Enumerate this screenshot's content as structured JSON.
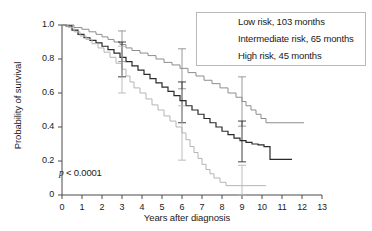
{
  "chart_data": {
    "type": "line",
    "title": "",
    "xlabel": "Years after diagnosis",
    "ylabel": "Probability of survival",
    "xlim": [
      0,
      13
    ],
    "ylim": [
      0,
      1.0
    ],
    "grid": false,
    "xticks": [
      "0",
      "1",
      "2",
      "3",
      "4",
      "5",
      "6",
      "7",
      "8",
      "9",
      "10",
      "11",
      "12",
      "13"
    ],
    "yticks": [
      "0",
      "0.2",
      "0.4",
      "0.6",
      "0.8",
      "1.0"
    ],
    "annotation": "p < 0.0001",
    "annotation_p": "p",
    "annotation_rest": " < 0.0001",
    "legend_position": "top-right",
    "series": [
      {
        "name": "Low risk, 103 months",
        "color": "#8d8d8d",
        "width": 1.0,
        "points": [
          [
            0,
            1.0
          ],
          [
            0.25,
            1.0
          ],
          [
            0.6,
            0.985
          ],
          [
            1.0,
            0.975
          ],
          [
            1.35,
            0.96
          ],
          [
            1.7,
            0.945
          ],
          [
            2.0,
            0.93
          ],
          [
            2.3,
            0.915
          ],
          [
            2.6,
            0.9
          ],
          [
            2.9,
            0.885
          ],
          [
            3.2,
            0.865
          ],
          [
            3.5,
            0.85
          ],
          [
            3.9,
            0.835
          ],
          [
            4.3,
            0.82
          ],
          [
            4.7,
            0.8
          ],
          [
            5.1,
            0.78
          ],
          [
            5.5,
            0.765
          ],
          [
            5.9,
            0.745
          ],
          [
            6.3,
            0.72
          ],
          [
            6.7,
            0.7
          ],
          [
            7.1,
            0.675
          ],
          [
            7.5,
            0.655
          ],
          [
            7.9,
            0.63
          ],
          [
            8.3,
            0.6
          ],
          [
            8.7,
            0.575
          ],
          [
            9.0,
            0.55
          ],
          [
            9.2,
            0.525
          ],
          [
            9.45,
            0.5
          ],
          [
            9.7,
            0.475
          ],
          [
            9.95,
            0.45
          ],
          [
            10.2,
            0.425
          ],
          [
            12.1,
            0.425
          ]
        ],
        "errorbars": [
          {
            "x": 3.0,
            "y": 0.875,
            "lo": 0.785,
            "hi": 0.965
          },
          {
            "x": 6.0,
            "y": 0.745,
            "lo": 0.625,
            "hi": 0.86
          },
          {
            "x": 9.0,
            "y": 0.55,
            "lo": 0.405,
            "hi": 0.695
          }
        ]
      },
      {
        "name": "Intermediate risk, 65 months",
        "color": "#2a2a2a",
        "width": 1.2,
        "points": [
          [
            0,
            1.0
          ],
          [
            0.2,
            0.995
          ],
          [
            0.5,
            0.97
          ],
          [
            0.8,
            0.945
          ],
          [
            1.1,
            0.925
          ],
          [
            1.4,
            0.91
          ],
          [
            1.7,
            0.895
          ],
          [
            2.0,
            0.875
          ],
          [
            2.3,
            0.855
          ],
          [
            2.6,
            0.835
          ],
          [
            2.9,
            0.81
          ],
          [
            3.2,
            0.785
          ],
          [
            3.5,
            0.76
          ],
          [
            3.8,
            0.735
          ],
          [
            4.1,
            0.71
          ],
          [
            4.4,
            0.685
          ],
          [
            4.7,
            0.66
          ],
          [
            5.0,
            0.635
          ],
          [
            5.3,
            0.61
          ],
          [
            5.6,
            0.585
          ],
          [
            5.9,
            0.555
          ],
          [
            6.2,
            0.525
          ],
          [
            6.5,
            0.5
          ],
          [
            6.8,
            0.475
          ],
          [
            7.1,
            0.45
          ],
          [
            7.4,
            0.425
          ],
          [
            7.7,
            0.4
          ],
          [
            8.0,
            0.375
          ],
          [
            8.3,
            0.355
          ],
          [
            8.6,
            0.335
          ],
          [
            8.9,
            0.32
          ],
          [
            9.2,
            0.31
          ],
          [
            9.5,
            0.3
          ],
          [
            9.8,
            0.295
          ],
          [
            10.1,
            0.285
          ],
          [
            10.4,
            0.21
          ],
          [
            11.5,
            0.21
          ]
        ],
        "errorbars": [
          {
            "x": 3.0,
            "y": 0.8,
            "lo": 0.695,
            "hi": 0.9
          },
          {
            "x": 6.0,
            "y": 0.545,
            "lo": 0.425,
            "hi": 0.665
          },
          {
            "x": 9.0,
            "y": 0.315,
            "lo": 0.195,
            "hi": 0.435
          }
        ]
      },
      {
        "name": "High risk, 45 months",
        "color": "#b5b5b5",
        "width": 1.0,
        "points": [
          [
            0,
            1.0
          ],
          [
            0.3,
            0.985
          ],
          [
            0.6,
            0.96
          ],
          [
            0.9,
            0.935
          ],
          [
            1.2,
            0.915
          ],
          [
            1.5,
            0.89
          ],
          [
            1.8,
            0.865
          ],
          [
            2.1,
            0.84
          ],
          [
            2.4,
            0.81
          ],
          [
            2.7,
            0.775
          ],
          [
            3.0,
            0.74
          ],
          [
            3.2,
            0.7
          ],
          [
            3.4,
            0.665
          ],
          [
            3.6,
            0.63
          ],
          [
            3.9,
            0.6
          ],
          [
            4.2,
            0.565
          ],
          [
            4.5,
            0.53
          ],
          [
            4.8,
            0.5
          ],
          [
            5.1,
            0.465
          ],
          [
            5.4,
            0.435
          ],
          [
            5.7,
            0.4
          ],
          [
            6.0,
            0.365
          ],
          [
            6.2,
            0.325
          ],
          [
            6.4,
            0.285
          ],
          [
            6.6,
            0.25
          ],
          [
            6.8,
            0.215
          ],
          [
            7.0,
            0.18
          ],
          [
            7.2,
            0.15
          ],
          [
            7.4,
            0.125
          ],
          [
            7.6,
            0.1
          ],
          [
            7.9,
            0.075
          ],
          [
            8.2,
            0.055
          ],
          [
            10.2,
            0.055
          ]
        ],
        "errorbars": [
          {
            "x": 3.0,
            "y": 0.74,
            "lo": 0.6,
            "hi": 0.875
          },
          {
            "x": 6.0,
            "y": 0.365,
            "lo": 0.205,
            "hi": 0.525
          },
          {
            "x": 9.0,
            "y": 0.055,
            "lo": 0.0,
            "hi": 0.175
          }
        ]
      }
    ]
  },
  "axis": {
    "color": "#4a4a4a"
  }
}
